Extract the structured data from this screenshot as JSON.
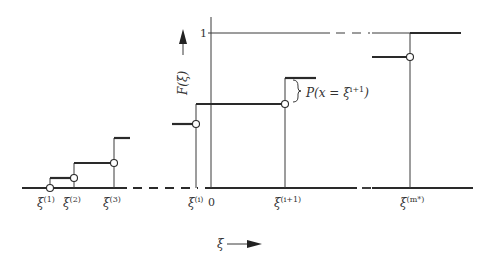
{
  "diagram": {
    "type": "step-cdf",
    "y_axis_label": "F(ξ)",
    "y_tick_one": "1",
    "x_axis_label": "ξ",
    "origin_label": "0",
    "jump_annotation": "P(x = ξ",
    "jump_annotation_sup": "i+1",
    "jump_annotation_close": ")",
    "points": [
      {
        "base": "ξ",
        "sup": "(1)"
      },
      {
        "base": "ξ",
        "sup": "(2)"
      },
      {
        "base": "ξ",
        "sup": "(3)"
      },
      {
        "base": "ξ",
        "sup": "(i)"
      },
      {
        "base": "ξ",
        "sup": "(i+1)"
      },
      {
        "base": "ξ",
        "sup": "(m*)"
      }
    ]
  }
}
